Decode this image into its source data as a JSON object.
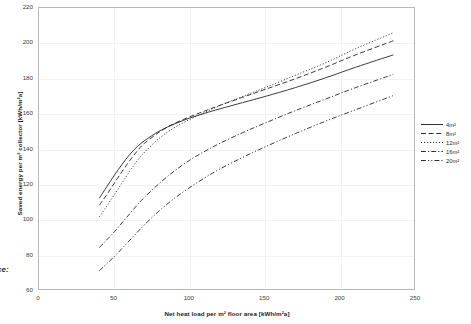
{
  "source_note": "rce:",
  "chart_data": {
    "type": "line",
    "title": "",
    "xlabel": "Net heat load per m² floor area [kWh/m²a]",
    "ylabel": "Saved energy per m² collector [kWh/m²a]",
    "xlim": [
      0,
      250
    ],
    "ylim": [
      60,
      220
    ],
    "xticks": [
      0,
      50,
      100,
      150,
      200,
      250
    ],
    "yticks": [
      60,
      80,
      100,
      120,
      140,
      160,
      180,
      200,
      220
    ],
    "grid": true,
    "legend_position": "right",
    "series": [
      {
        "name": "4m²",
        "style": "solid",
        "x": [
          40,
          45,
          50,
          55,
          60,
          65,
          70,
          80,
          90,
          100,
          110,
          120,
          135,
          150,
          170,
          190,
          210,
          235
        ],
        "y": [
          112.5,
          119.0,
          125.5,
          131.5,
          137.0,
          141.5,
          145.0,
          150.5,
          154.5,
          157.8,
          160.5,
          163.0,
          166.5,
          170.0,
          175.0,
          180.5,
          186.5,
          193.5
        ]
      },
      {
        "name": "8m²",
        "style": "dashed",
        "x": [
          40,
          45,
          50,
          55,
          60,
          65,
          70,
          80,
          90,
          100,
          110,
          120,
          135,
          150,
          170,
          190,
          210,
          235
        ],
        "y": [
          108.5,
          114.5,
          121.0,
          127.5,
          133.5,
          139.0,
          143.5,
          150.0,
          154.8,
          158.5,
          161.8,
          165.0,
          169.5,
          174.0,
          180.0,
          186.5,
          193.5,
          201.5
        ]
      },
      {
        "name": "12m²",
        "style": "dotted",
        "x": [
          40,
          45,
          50,
          55,
          60,
          65,
          70,
          80,
          90,
          100,
          110,
          120,
          135,
          150,
          170,
          190,
          210,
          235
        ],
        "y": [
          102.0,
          108.0,
          114.5,
          121.0,
          127.5,
          133.5,
          138.5,
          146.5,
          152.5,
          157.0,
          161.0,
          164.8,
          170.0,
          175.0,
          182.0,
          189.0,
          197.0,
          206.0
        ]
      },
      {
        "name": "16m²",
        "style": "dashdot",
        "x": [
          40,
          45,
          50,
          55,
          60,
          65,
          70,
          80,
          90,
          100,
          110,
          120,
          135,
          150,
          170,
          190,
          210,
          235
        ],
        "y": [
          84.5,
          89.0,
          93.5,
          98.5,
          103.5,
          108.5,
          113.0,
          121.0,
          128.0,
          134.0,
          139.0,
          143.5,
          149.5,
          155.0,
          162.0,
          168.5,
          175.0,
          182.5
        ]
      },
      {
        "name": "20m²",
        "style": "dashdotdot",
        "x": [
          40,
          45,
          50,
          55,
          60,
          65,
          70,
          80,
          90,
          100,
          110,
          120,
          135,
          150,
          170,
          190,
          210,
          235
        ],
        "y": [
          71.5,
          75.5,
          79.5,
          84.0,
          88.5,
          93.0,
          97.5,
          105.5,
          112.5,
          118.5,
          124.0,
          129.0,
          135.5,
          141.5,
          149.0,
          156.0,
          162.5,
          170.5
        ]
      }
    ]
  }
}
